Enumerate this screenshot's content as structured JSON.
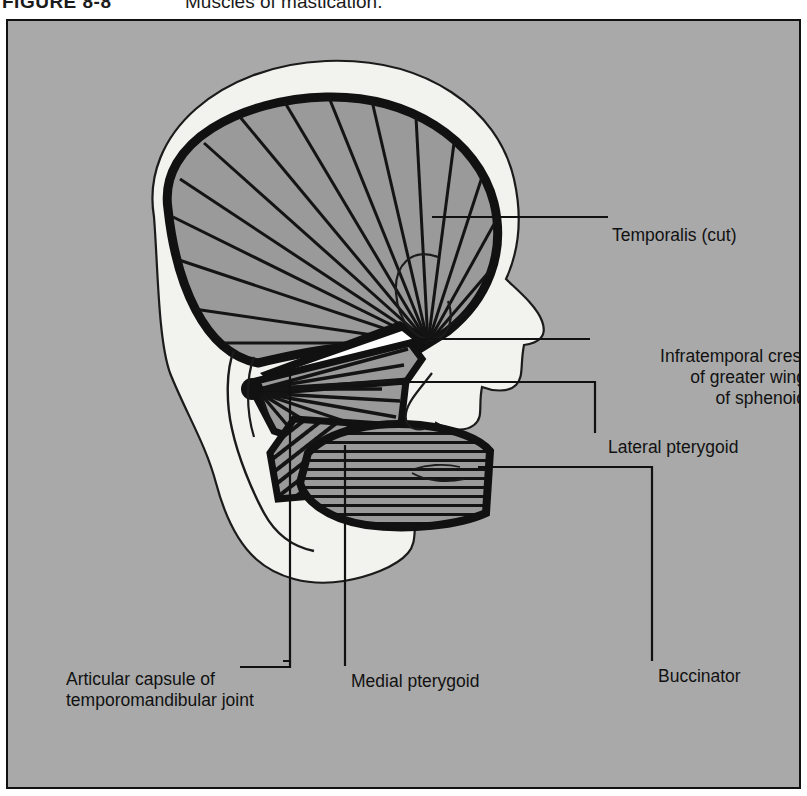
{
  "figure": {
    "number": "FIGURE 8-8",
    "title": "Muscles of mastication."
  },
  "colors": {
    "plate_background": "#a9a9a9",
    "muscle_fill": "#9a9a9a",
    "bone_fill": "#f2f2ee",
    "outline": "#111111",
    "page_background": "#ffffff"
  },
  "labels": {
    "temporalis": "Temporalis (cut)",
    "infratemporal_line1": "Infratemporal crest",
    "infratemporal_line2": "of  greater wing",
    "infratemporal_line3": "of sphenoid",
    "lateral_pterygoid": "Lateral pterygoid",
    "buccinator": "Buccinator",
    "medial_pterygoid": "Medial pterygoid",
    "articular_capsule_line1": "Articular capsule of",
    "articular_capsule_line2": "temporomandibular joint"
  },
  "diagram": {
    "type": "anatomical-illustration",
    "structures": [
      {
        "name": "temporalis",
        "rendering": "fan of radiating fibers, gray fill, thick black border"
      },
      {
        "name": "lateral-pterygoid",
        "rendering": "two-headed fan of fibers converging anteriorly"
      },
      {
        "name": "medial-pterygoid",
        "rendering": "diagonally striated quadrilateral"
      },
      {
        "name": "buccinator",
        "rendering": "horizontally striated oval"
      },
      {
        "name": "skull-profile",
        "rendering": "off-white silhouette, facial profile facing right"
      },
      {
        "name": "mandible",
        "rendering": "off-white ramus and body below the muscles"
      }
    ]
  }
}
